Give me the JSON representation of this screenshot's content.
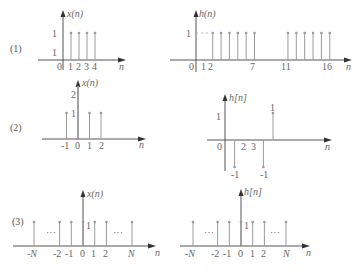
{
  "panels": [
    {
      "label": "(1)",
      "left": {
        "ylabel": "x(n)",
        "xlabel": "n",
        "stems": [
          {
            "n": 1,
            "v": 1
          },
          {
            "n": 2,
            "v": 1
          },
          {
            "n": 3,
            "v": 1
          },
          {
            "n": 4,
            "v": 1
          }
        ],
        "xticks": [
          "0",
          "1",
          "2",
          "3",
          "4"
        ],
        "yticks": [
          "1",
          "1"
        ]
      },
      "right": {
        "ylabel": "h(n)",
        "xlabel": "n",
        "stems": [
          {
            "n": 2,
            "v": 1
          },
          {
            "n": 3,
            "v": 1
          },
          {
            "n": 4,
            "v": 1
          },
          {
            "n": 5,
            "v": 1
          },
          {
            "n": 6,
            "v": 1
          },
          {
            "n": 7,
            "v": 1
          },
          {
            "n": 11,
            "v": 1
          },
          {
            "n": 12,
            "v": 1
          },
          {
            "n": 13,
            "v": 1
          },
          {
            "n": 14,
            "v": 1
          },
          {
            "n": 15,
            "v": 1
          },
          {
            "n": 16,
            "v": 1
          }
        ],
        "xticks": [
          "0",
          "1",
          "2",
          "7",
          "11",
          "16"
        ],
        "yticks": [
          "1"
        ]
      }
    },
    {
      "label": "(2)",
      "left": {
        "ylabel": "x(n)",
        "xlabel": "n",
        "stems": [
          {
            "n": -1,
            "v": 1
          },
          {
            "n": 0,
            "v": 2
          },
          {
            "n": 1,
            "v": 1
          },
          {
            "n": 2,
            "v": 1
          }
        ],
        "xticks": [
          "-1",
          "0",
          "1",
          "2"
        ],
        "yticks": [
          "2",
          "1"
        ]
      },
      "right": {
        "ylabel": "h[n]",
        "xlabel": "n",
        "stems": [
          {
            "n": 1,
            "v": -1
          },
          {
            "n": 4,
            "v": -1
          },
          {
            "n": 5,
            "v": 1
          }
        ],
        "xticks": [
          "0",
          "2",
          "3"
        ],
        "yticks": [
          "1"
        ],
        "stem_labels": [
          "-1",
          "-1",
          "1"
        ]
      }
    },
    {
      "label": "(3)",
      "left": {
        "ylabel": "x(n)",
        "xlabel": "n",
        "stems": [
          {
            "n": "-N",
            "v": 1
          },
          {
            "n": -2,
            "v": 1
          },
          {
            "n": -1,
            "v": 1
          },
          {
            "n": 0,
            "v": 1
          },
          {
            "n": 1,
            "v": 1
          },
          {
            "n": 2,
            "v": 1
          },
          {
            "n": "N",
            "v": 1
          }
        ],
        "xticks": [
          "-N",
          "-2",
          "-1",
          "0",
          "1",
          "2",
          "N"
        ],
        "yticks": [
          "1"
        ],
        "ellipsis": "···"
      },
      "right": {
        "ylabel": "h[n]",
        "xlabel": "n",
        "stems": [
          {
            "n": "-N",
            "v": 1
          },
          {
            "n": -2,
            "v": 1
          },
          {
            "n": -1,
            "v": 1
          },
          {
            "n": 0,
            "v": 1
          },
          {
            "n": 1,
            "v": 1
          },
          {
            "n": 2,
            "v": 1
          },
          {
            "n": "N",
            "v": 1
          }
        ],
        "xticks": [
          "-N",
          "-2",
          "-1",
          "0",
          "1",
          "2",
          "N"
        ],
        "yticks": [
          "1"
        ],
        "ellipsis": "···"
      }
    }
  ]
}
